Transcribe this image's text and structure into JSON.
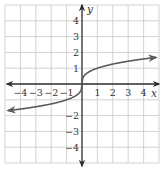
{
  "chart_data": {
    "type": "line",
    "title": "",
    "xlabel": "x",
    "ylabel": "y",
    "xlim": [
      -5,
      5
    ],
    "ylim": [
      -5,
      5
    ],
    "grid": true,
    "x_ticks": [
      "−4",
      "−3",
      "−2",
      "−1",
      "1",
      "2",
      "3",
      "4"
    ],
    "y_ticks": [
      "4",
      "3",
      "2",
      "1",
      "−1",
      "−2",
      "−3",
      "−4"
    ],
    "series": [
      {
        "name": "y = ∛x",
        "color": "#5a5a5a",
        "arrows_both_ends": true,
        "x": [
          -4.8,
          -4,
          -3,
          -2,
          -1,
          -0.5,
          -0.1,
          0,
          0.1,
          0.5,
          1,
          2,
          3,
          4,
          4.8
        ],
        "y": [
          -1.69,
          -1.59,
          -1.44,
          -1.26,
          -1.0,
          -0.79,
          -0.46,
          0,
          0.46,
          0.79,
          1.0,
          1.26,
          1.44,
          1.59,
          1.69
        ]
      }
    ]
  },
  "labels": {
    "x_axis": "x",
    "y_axis": "y",
    "x_ticks": [
      "−4",
      "−3",
      "−2",
      "−1",
      "1",
      "2",
      "3",
      "4"
    ],
    "y_ticks": [
      "4",
      "3",
      "2",
      "1",
      "−1",
      "−2",
      "−3",
      "−4"
    ]
  },
  "colors": {
    "grid": "#c8c8c8",
    "axis": "#2b2b2b",
    "curve": "#5a5a5a"
  }
}
